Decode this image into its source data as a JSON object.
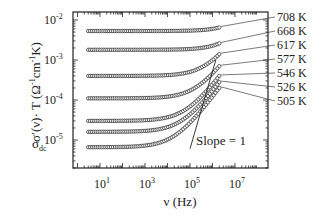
{
  "chart_data": {
    "type": "scatter",
    "title": "",
    "xlabel": "ν (Hz)",
    "ylabel": "σ′(ν)·T (Ω⁻¹cm⁻¹K)",
    "xscale": "log",
    "yscale": "log",
    "xlim": [
      2,
      30000000.0
    ],
    "ylim": [
      2.5e-06,
      0.012
    ],
    "x_ticks": [
      "10^1",
      "10^3",
      "10^5",
      "10^7"
    ],
    "y_ticks": [
      "10^-2",
      "10^-3",
      "10^-4",
      "10^-5"
    ],
    "grid": false,
    "legend": "inline labels at right end of each series",
    "series": [
      {
        "name": "708 K",
        "dc_level": 0.0053,
        "x_start": 3,
        "x_end": 2000000.0,
        "end_value": 0.0065
      },
      {
        "name": "668 K",
        "dc_level": 0.0018,
        "x_start": 3,
        "x_end": 2000000.0,
        "end_value": 0.0026
      },
      {
        "name": "617 K",
        "dc_level": 0.0004,
        "x_start": 3,
        "x_end": 2000000.0,
        "end_value": 0.0014
      },
      {
        "name": "577 K",
        "dc_level": 0.00011,
        "x_start": 3,
        "x_end": 2000000.0,
        "end_value": 0.0007
      },
      {
        "name": "546 K",
        "dc_level": 3e-05,
        "x_start": 3,
        "x_end": 2000000.0,
        "end_value": 0.0004
      },
      {
        "name": "526 K",
        "dc_level": 1.6e-05,
        "x_start": 3,
        "x_end": 2000000.0,
        "end_value": 0.00028
      },
      {
        "name": "505 K",
        "dc_level": 6.6e-06,
        "x_start": 3,
        "x_end": 2000000.0,
        "end_value": 0.0002
      }
    ],
    "annotations": [
      {
        "text": "σ_dc",
        "position": "left of 505 K plateau"
      },
      {
        "text": "Slope = 1",
        "position": "lower right, below reference line"
      }
    ],
    "reference_line": {
      "label": "Slope = 1",
      "from": [
        100000.0,
        6e-06
      ],
      "to": [
        1400000.0,
        0.001
      ]
    }
  },
  "labels": {
    "ylabel_main": "σ′(ν)· T (Ω",
    "ylabel_unit": "cm",
    "ylabel_end": "K)",
    "xlabel": "ν (Hz)",
    "sigma_dc": "σ",
    "sigma_dc_sub": "dc",
    "slope": "Slope = 1"
  }
}
